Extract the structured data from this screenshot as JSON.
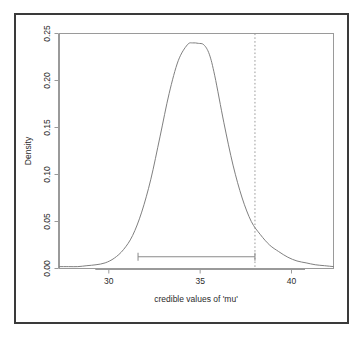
{
  "chart_data": {
    "type": "line",
    "title": "",
    "subtitle": "",
    "xlabel": "credible values of 'mu'",
    "ylabel": "Density",
    "xlim": [
      27.3,
      42.3
    ],
    "ylim": [
      0.0,
      0.25
    ],
    "xticks": [
      30,
      35,
      40
    ],
    "xtick_labels": [
      "30",
      "35",
      "40"
    ],
    "yticks": [
      0.0,
      0.05,
      0.1,
      0.15,
      0.2,
      0.25
    ],
    "ytick_labels": [
      "0.00",
      "0.05",
      "0.10",
      "0.15",
      "0.20",
      "0.25"
    ],
    "grid": false,
    "legend": null,
    "series": [
      {
        "name": "posterior density of mu",
        "style": "solid",
        "color": "#808080",
        "x": [
          27.3,
          27.8,
          28.3,
          28.8,
          29.3,
          29.8,
          30.3,
          30.8,
          31.3,
          31.8,
          32.3,
          32.8,
          33.3,
          33.8,
          34.3,
          34.6,
          34.9,
          35.2,
          35.5,
          35.8,
          36.3,
          36.8,
          37.3,
          37.8,
          38.3,
          38.8,
          39.3,
          39.8,
          40.3,
          40.8,
          41.3,
          41.8,
          42.3
        ],
        "y": [
          0.002,
          0.002,
          0.002,
          0.003,
          0.004,
          0.006,
          0.011,
          0.02,
          0.035,
          0.06,
          0.095,
          0.14,
          0.186,
          0.221,
          0.238,
          0.24,
          0.2395,
          0.238,
          0.228,
          0.205,
          0.155,
          0.11,
          0.075,
          0.05,
          0.036,
          0.025,
          0.018,
          0.012,
          0.008,
          0.006,
          0.004,
          0.003,
          0.002
        ]
      }
    ],
    "annotations": [
      {
        "name": "credible-interval",
        "type": "interval-bar",
        "x_start": 31.6,
        "x_end": 38.0,
        "y": 0.0125,
        "caps": true,
        "color": "#8a8a8a"
      },
      {
        "name": "reference-line",
        "type": "vline",
        "x": 38.0,
        "style": "dotted",
        "color": "#9a9a9a"
      }
    ]
  },
  "axes": {
    "x_label": "credible values of 'mu'",
    "y_label": "Density",
    "x_tick_labels": [
      "30",
      "35",
      "40"
    ],
    "y_tick_labels": [
      "0.00",
      "0.05",
      "0.10",
      "0.15",
      "0.20",
      "0.25"
    ]
  },
  "colors": {
    "frame": "#3a3a3a",
    "axis": "#9a9a9a",
    "curve": "#808080",
    "interval": "#8a8a8a",
    "refline": "#9a9a9a",
    "text": "#2b2b2b",
    "background": "#ffffff"
  }
}
